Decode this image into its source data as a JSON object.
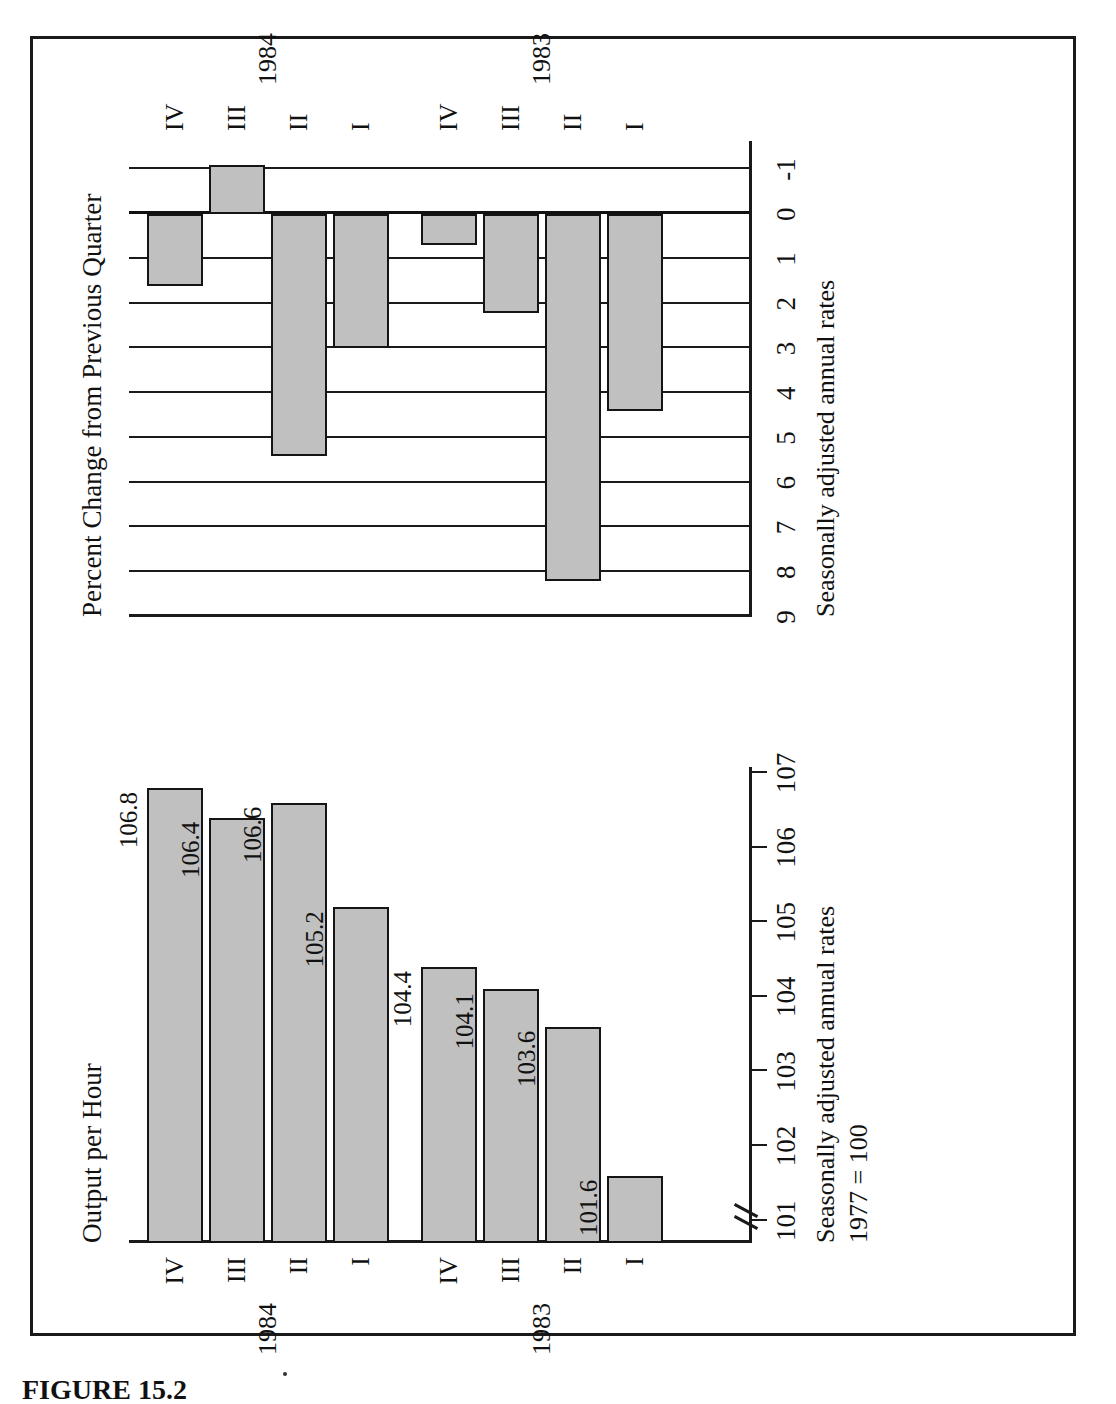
{
  "figure": {
    "caption": "FIGURE 15.2",
    "orientation": "rotated-90-ccw"
  },
  "colors": {
    "bar_fill": "#c0c0c0",
    "bar_stroke": "#151515",
    "axis": "#1a1a1a",
    "text": "#111111",
    "page": "#ffffff"
  },
  "panels": {
    "left": {
      "title": "Output per Hour",
      "note_line1": "Seasonally adjusted annual rates",
      "note_line2": "1977 = 100",
      "year_labels": [
        "1983",
        "1984"
      ]
    },
    "right": {
      "title": "Percent Change from Previous Quarter",
      "note_line1": "Seasonally adjusted annual rates",
      "year_labels": [
        "1983",
        "1984"
      ]
    }
  },
  "chart_data": [
    {
      "type": "bar",
      "id": "output-per-hour",
      "title": "Output per Hour",
      "subtitle": "Seasonally adjusted annual rates, 1977 = 100",
      "xlabel": "",
      "ylabel": "Index (1977 = 100)",
      "ylim": [
        100.7,
        107
      ],
      "y_axis_broken": true,
      "yticks": [
        101,
        102,
        103,
        104,
        105,
        106,
        107
      ],
      "ytick_labels": [
        "101",
        "102",
        "103",
        "104",
        "105",
        "106",
        "107"
      ],
      "grid": false,
      "categories": [
        "I",
        "II",
        "III",
        "IV",
        "I",
        "II",
        "III",
        "IV"
      ],
      "group_labels": [
        "1983",
        "1983",
        "1983",
        "1983",
        "1984",
        "1984",
        "1984",
        "1984"
      ],
      "values": [
        101.6,
        103.6,
        104.1,
        104.4,
        105.2,
        106.6,
        106.4,
        106.8
      ],
      "data_labels": [
        "101.6",
        "103.6",
        "104.1",
        "104.4",
        "105.2",
        "106.6",
        "106.4",
        "106.8"
      ],
      "legend": []
    },
    {
      "type": "bar",
      "id": "percent-change-from-previous-quarter",
      "title": "Percent Change from Previous Quarter",
      "subtitle": "Seasonally adjusted annual rates",
      "xlabel": "",
      "ylabel": "Percent",
      "ylim": [
        -1.5,
        9
      ],
      "yticks": [
        -1,
        0,
        1,
        2,
        3,
        4,
        5,
        6,
        7,
        8,
        9
      ],
      "ytick_labels": [
        "-1",
        "0",
        "1",
        "2",
        "3",
        "4",
        "5",
        "6",
        "7",
        "8",
        "9"
      ],
      "grid": true,
      "categories": [
        "I",
        "II",
        "III",
        "IV",
        "I",
        "II",
        "III",
        "IV"
      ],
      "group_labels": [
        "1983",
        "1983",
        "1983",
        "1983",
        "1984",
        "1984",
        "1984",
        "1984"
      ],
      "values": [
        4.4,
        8.2,
        2.2,
        0.7,
        3.0,
        5.4,
        -1.1,
        1.6
      ],
      "data_labels": [],
      "legend": []
    }
  ]
}
